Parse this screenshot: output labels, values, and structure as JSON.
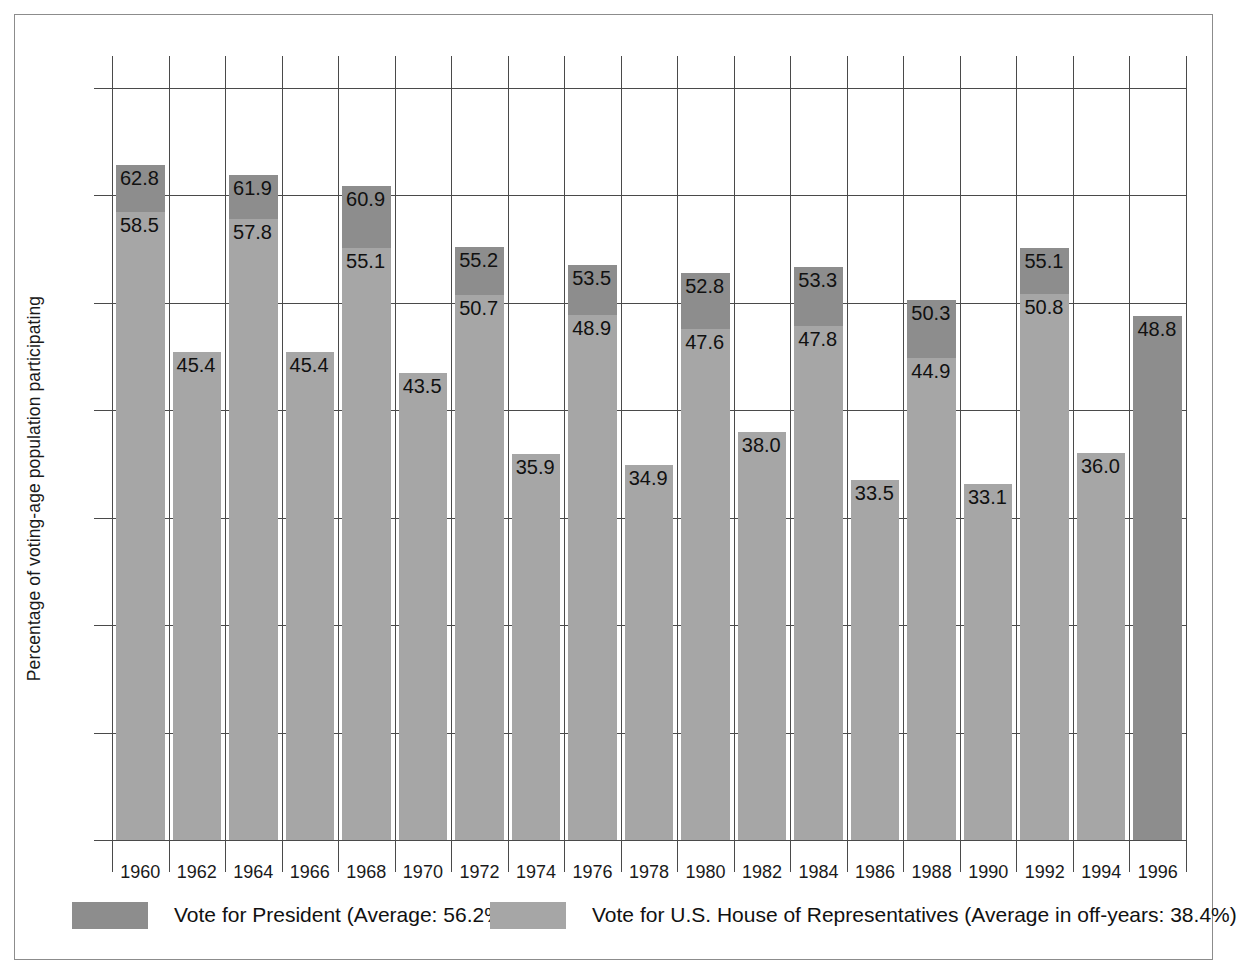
{
  "chart_data": {
    "type": "bar",
    "title": "",
    "xlabel": "",
    "ylabel": "Percentage of voting-age population participating",
    "ylim": [
      0,
      70
    ],
    "yticks": [
      0,
      10,
      20,
      30,
      40,
      50,
      60,
      70
    ],
    "grid": true,
    "legend_position": "bottom",
    "categories": [
      "1960",
      "1962",
      "1964",
      "1966",
      "1968",
      "1970",
      "1972",
      "1974",
      "1976",
      "1978",
      "1980",
      "1982",
      "1984",
      "1986",
      "1988",
      "1990",
      "1992",
      "1994",
      "1996"
    ],
    "series": [
      {
        "name": "Vote for President (Average: 56.2%)",
        "color": "#8d8d8d",
        "values": [
          62.8,
          null,
          61.9,
          null,
          60.9,
          null,
          55.2,
          null,
          53.5,
          null,
          52.8,
          null,
          53.3,
          null,
          50.3,
          null,
          55.1,
          null,
          48.8
        ]
      },
      {
        "name": "Vote for U.S. House of Representatives (Average in off-years: 38.4%)",
        "color": "#a6a6a6",
        "values": [
          58.5,
          45.4,
          57.8,
          45.4,
          55.1,
          43.5,
          50.7,
          35.9,
          48.9,
          34.9,
          47.6,
          38.0,
          47.8,
          33.5,
          44.9,
          33.1,
          50.8,
          36.0,
          null
        ]
      }
    ],
    "bars": [
      {
        "year": "1960",
        "president": 62.8,
        "house": 58.5
      },
      {
        "year": "1962",
        "president": null,
        "house": 45.4
      },
      {
        "year": "1964",
        "president": 61.9,
        "house": 57.8
      },
      {
        "year": "1966",
        "president": null,
        "house": 45.4
      },
      {
        "year": "1968",
        "president": 60.9,
        "house": 55.1
      },
      {
        "year": "1970",
        "president": null,
        "house": 43.5
      },
      {
        "year": "1972",
        "president": 55.2,
        "house": 50.7
      },
      {
        "year": "1974",
        "president": null,
        "house": 35.9
      },
      {
        "year": "1976",
        "president": 53.5,
        "house": 48.9
      },
      {
        "year": "1978",
        "president": null,
        "house": 34.9
      },
      {
        "year": "1980",
        "president": 52.8,
        "house": 47.6
      },
      {
        "year": "1982",
        "president": null,
        "house": 38.0
      },
      {
        "year": "1984",
        "president": 53.3,
        "house": 47.8
      },
      {
        "year": "1986",
        "president": null,
        "house": 33.5
      },
      {
        "year": "1988",
        "president": 50.3,
        "house": 44.9
      },
      {
        "year": "1990",
        "president": null,
        "house": 33.1
      },
      {
        "year": "1992",
        "president": 55.1,
        "house": 50.8
      },
      {
        "year": "1994",
        "president": null,
        "house": 36.0
      },
      {
        "year": "1996",
        "president": 48.8,
        "house": null
      }
    ],
    "averages": {
      "president": "56.2%",
      "house_off_years": "38.4%"
    }
  },
  "legend": {
    "president_label": "Vote for President (Average: 56.2%)",
    "house_label": "Vote for U.S. House of Representatives (Average in off-years: 38.4%)"
  },
  "colors": {
    "president": "#8d8d8d",
    "house": "#a6a6a6",
    "grid": "#4a4a4a",
    "frame": "#8c8c8c"
  }
}
